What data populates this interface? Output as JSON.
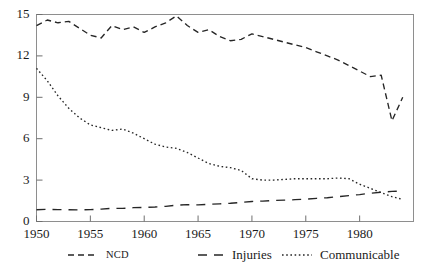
{
  "chart_data": {
    "type": "line",
    "title": "",
    "subtitle": "",
    "xlabel": "",
    "ylabel": "",
    "xlim": [
      1950,
      1985
    ],
    "ylim": [
      0,
      15
    ],
    "xticks": [
      1950,
      1955,
      1960,
      1965,
      1970,
      1975,
      1980
    ],
    "yticks": [
      0,
      3,
      6,
      9,
      12,
      15
    ],
    "grid": false,
    "legend_position": "bottom",
    "x": [
      1950,
      1951,
      1952,
      1953,
      1954,
      1955,
      1956,
      1957,
      1958,
      1959,
      1960,
      1961,
      1962,
      1963,
      1964,
      1965,
      1966,
      1967,
      1968,
      1969,
      1970,
      1971,
      1972,
      1973,
      1974,
      1975,
      1976,
      1977,
      1978,
      1979,
      1980,
      1981,
      1982,
      1983,
      1984
    ],
    "series": [
      {
        "name": "NCD",
        "style": "dashed",
        "values": [
          14.2,
          14.6,
          14.4,
          14.5,
          14.0,
          13.5,
          13.3,
          14.2,
          13.9,
          14.1,
          13.7,
          14.1,
          14.4,
          14.9,
          14.2,
          13.7,
          13.9,
          13.4,
          13.1,
          13.2,
          13.6,
          13.4,
          13.2,
          13.0,
          12.8,
          12.6,
          12.3,
          12.0,
          11.7,
          11.3,
          10.9,
          10.5,
          10.6,
          7.3,
          9.0
        ]
      },
      {
        "name": "Injuries",
        "style": "long-dashed",
        "values": [
          0.85,
          0.88,
          0.86,
          0.85,
          0.84,
          0.86,
          0.9,
          0.95,
          0.95,
          1.0,
          1.02,
          1.05,
          1.1,
          1.18,
          1.22,
          1.2,
          1.25,
          1.28,
          1.32,
          1.38,
          1.45,
          1.48,
          1.52,
          1.55,
          1.58,
          1.62,
          1.68,
          1.72,
          1.8,
          1.88,
          1.95,
          2.05,
          2.12,
          2.18,
          2.2
        ]
      },
      {
        "name": "Communicable",
        "style": "dotted",
        "values": [
          11.1,
          10.2,
          9.1,
          8.2,
          7.5,
          7.0,
          6.8,
          6.6,
          6.7,
          6.4,
          6.0,
          5.6,
          5.4,
          5.3,
          5.0,
          4.6,
          4.2,
          4.0,
          3.9,
          3.7,
          3.1,
          3.0,
          3.0,
          3.05,
          3.1,
          3.1,
          3.1,
          3.1,
          3.15,
          3.1,
          2.7,
          2.4,
          2.1,
          1.8,
          1.6
        ]
      }
    ],
    "legend": [
      {
        "label": "NCD",
        "style": "dashed"
      },
      {
        "label": "Injuries",
        "style": "long-dashed"
      },
      {
        "label": "Communicable",
        "style": "dotted"
      }
    ]
  }
}
